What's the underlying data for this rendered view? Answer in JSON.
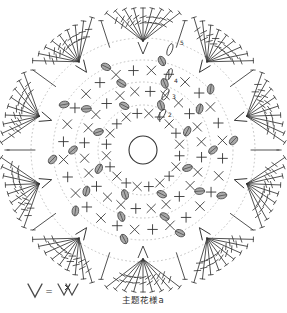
{
  "document": {
    "title": "主题花様a",
    "caption": "主题花様a",
    "background_color": "#ffffff",
    "ink_color": "#333333",
    "guide_color": "#b9b9b9",
    "fill_color": "#8a8a8a"
  },
  "legend": {
    "name": "stitch-equivalence-legend",
    "left_symbol": "V",
    "equals_sign": "=",
    "right_symbol": "V×V",
    "description": "V = V×V"
  },
  "round_labels": [
    {
      "id": "label-2",
      "text": "2",
      "x": 170,
      "y": 117
    },
    {
      "id": "label-3",
      "text": "3",
      "x": 174,
      "y": 99
    },
    {
      "id": "label-4",
      "text": "4",
      "x": 176,
      "y": 83
    },
    {
      "id": "label-5",
      "text": "5",
      "x": 182,
      "y": 45
    }
  ],
  "chart_data": {
    "type": "diagram",
    "title": "主题花様a",
    "subtitle": "",
    "xlabel": "",
    "ylabel": "",
    "center": {
      "x": 143,
      "y": 150
    },
    "magic_ring_radius": 14,
    "petal_count": 10,
    "round_count": 5,
    "rounds": [
      {
        "round": 1,
        "label": "1",
        "radius": 14,
        "stitch": "magic-ring",
        "count": 1,
        "guide": false
      },
      {
        "round": 2,
        "label": "2",
        "radius": 45,
        "stitch": "single-crochet-x",
        "count": 20,
        "guide": true
      },
      {
        "round": 3,
        "label": "3",
        "radius": 68,
        "stitch": "double-crochet-plus",
        "count": 24,
        "guide": true
      },
      {
        "round": 4,
        "label": "4",
        "radius": 90,
        "stitch": "v-stitch",
        "count": 28,
        "guide": true
      },
      {
        "round": 5,
        "label": "5",
        "radius": 112,
        "stitch": "treble-fan-petal",
        "count": 10,
        "guide": true
      }
    ],
    "guide_rings": [
      45,
      68,
      90,
      112
    ],
    "petals": {
      "count": 10,
      "start_angle_deg": -90,
      "spokes_per_petal": 9,
      "inner_radius": 112,
      "outer_radius": 142,
      "spread_deg": 30,
      "bar_count": 2
    },
    "symbols": [
      {
        "name": "magic-ring",
        "glyph": "O",
        "meaning": "chain ring / center loop"
      },
      {
        "name": "cross-x",
        "glyph": "X",
        "meaning": "single crochet"
      },
      {
        "name": "cross-plus",
        "glyph": "+",
        "meaning": "single crochet (alt)"
      },
      {
        "name": "puff-oval",
        "glyph": "oval",
        "meaning": "puff / bobble stitch",
        "fill": "#8a8a8a"
      },
      {
        "name": "treble-bar",
        "glyph": "line with crossbars",
        "meaning": "treble crochet"
      },
      {
        "name": "chain-oval",
        "glyph": "elongated oval",
        "meaning": "chain stitch"
      },
      {
        "name": "v-stitch",
        "glyph": "V",
        "meaning": "two stitches in one space"
      }
    ],
    "legend_entries": [
      {
        "symbol": "V",
        "equals": "=",
        "expansion": "V×V"
      }
    ],
    "annotations": [
      {
        "text": "2",
        "angle_deg": -62,
        "radius": 38
      },
      {
        "text": "3",
        "angle_deg": -68,
        "radius": 60
      },
      {
        "text": "4",
        "angle_deg": -71,
        "radius": 82
      },
      {
        "text": "5",
        "angle_deg": -75,
        "radius": 112
      }
    ],
    "grid": false,
    "legend_position": "bottom-left"
  }
}
